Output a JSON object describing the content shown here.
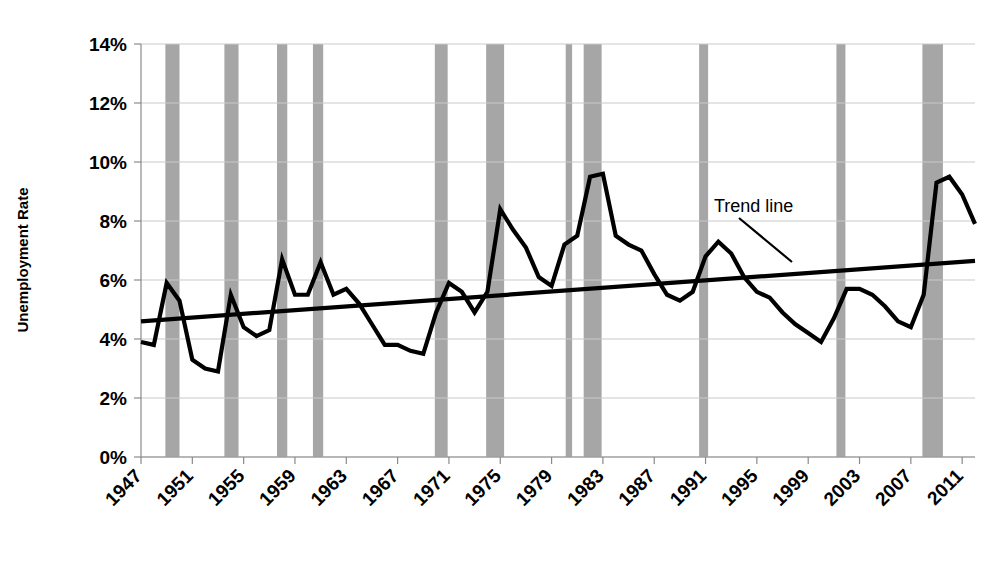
{
  "chart_data": {
    "type": "line",
    "title": "",
    "xlabel": "",
    "ylabel": "Unemployment Rate",
    "ylim": [
      0,
      14
    ],
    "xlim": [
      1947,
      2012
    ],
    "grid": true,
    "legend_position": "none",
    "y_ticks": [
      "0%",
      "2%",
      "4%",
      "6%",
      "8%",
      "10%",
      "12%",
      "14%"
    ],
    "y_tick_values": [
      0,
      2,
      4,
      6,
      8,
      10,
      12,
      14
    ],
    "x_ticks": [
      "1947",
      "1951",
      "1955",
      "1959",
      "1963",
      "1967",
      "1971",
      "1975",
      "1979",
      "1983",
      "1987",
      "1991",
      "1995",
      "1999",
      "2003",
      "2007",
      "2011"
    ],
    "x_tick_values": [
      1947,
      1951,
      1955,
      1959,
      1963,
      1967,
      1971,
      1975,
      1979,
      1983,
      1987,
      1991,
      1995,
      1999,
      2003,
      2007,
      2011
    ],
    "x": [
      1947,
      1948,
      1949,
      1950,
      1951,
      1952,
      1953,
      1954,
      1955,
      1956,
      1957,
      1958,
      1959,
      1960,
      1961,
      1962,
      1963,
      1964,
      1965,
      1966,
      1967,
      1968,
      1969,
      1970,
      1971,
      1972,
      1973,
      1974,
      1975,
      1976,
      1977,
      1978,
      1979,
      1980,
      1981,
      1982,
      1983,
      1984,
      1985,
      1986,
      1987,
      1988,
      1989,
      1990,
      1991,
      1992,
      1993,
      1994,
      1995,
      1996,
      1997,
      1998,
      1999,
      2000,
      2001,
      2002,
      2003,
      2004,
      2005,
      2006,
      2007,
      2008,
      2009,
      2010,
      2011,
      2012
    ],
    "series": [
      {
        "name": "Unemployment Rate",
        "color": "#000000",
        "values": [
          3.9,
          3.8,
          5.9,
          5.3,
          3.3,
          3.0,
          2.9,
          5.5,
          4.4,
          4.1,
          4.3,
          6.7,
          5.5,
          5.5,
          6.6,
          5.5,
          5.7,
          5.2,
          4.5,
          3.8,
          3.8,
          3.6,
          3.5,
          4.9,
          5.9,
          5.6,
          4.9,
          5.6,
          8.4,
          7.7,
          7.1,
          6.1,
          5.8,
          7.2,
          7.5,
          9.5,
          9.6,
          7.5,
          7.2,
          7.0,
          6.2,
          5.5,
          5.3,
          5.6,
          6.8,
          7.3,
          6.9,
          6.1,
          5.6,
          5.4,
          4.9,
          4.5,
          4.2,
          3.9,
          4.7,
          5.7,
          5.7,
          5.5,
          5.1,
          4.6,
          4.4,
          5.5,
          9.3,
          9.5,
          8.9,
          7.9
        ]
      }
    ],
    "trend_line": {
      "name": "Trend line",
      "color": "#000000",
      "start": {
        "x": 1947,
        "y": 4.6
      },
      "end": {
        "x": 2012,
        "y": 6.65
      },
      "annotation_label": "Trend line"
    },
    "recession_bands": {
      "color": "#a6a6a6",
      "label": "Recession",
      "bands": [
        {
          "start": 1948.9,
          "end": 1950.0
        },
        {
          "start": 1953.5,
          "end": 1954.6
        },
        {
          "start": 1957.6,
          "end": 1958.4
        },
        {
          "start": 1960.4,
          "end": 1961.2
        },
        {
          "start": 1969.9,
          "end": 1970.9
        },
        {
          "start": 1973.9,
          "end": 1975.3
        },
        {
          "start": 1980.1,
          "end": 1980.6
        },
        {
          "start": 1981.5,
          "end": 1982.9
        },
        {
          "start": 1990.5,
          "end": 1991.2
        },
        {
          "start": 2001.2,
          "end": 2001.9
        },
        {
          "start": 2007.9,
          "end": 2009.5
        }
      ]
    }
  },
  "axis": {
    "y_title": "Unemployment Rate"
  },
  "annotations": [
    {
      "id": "trend-line-callout",
      "text": "Trend line"
    }
  ],
  "colors": {
    "plot_line": "#000000",
    "trend_line": "#000000",
    "recession_band": "#a6a6a6",
    "grid": "#c9c9c9",
    "axis": "#8a8a8a",
    "background": "#ffffff",
    "text": "#000000"
  }
}
